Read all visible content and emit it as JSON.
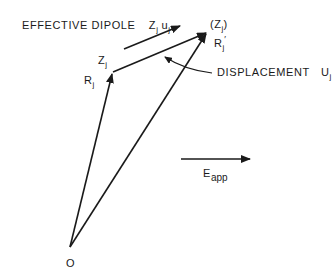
{
  "diagram": {
    "type": "vector-diagram",
    "labels": {
      "effective_dipole_text": "EFFECTIVE DIPOLE",
      "effective_dipole_symbol_z": "Z",
      "effective_dipole_symbol_z_sub": "j",
      "effective_dipole_symbol_u": "u",
      "effective_dipole_symbol_u_sub": "j",
      "zj_open": "(Z",
      "zj_sub": "j",
      "zj_close": ")",
      "rj_prime": "R",
      "rj_prime_sub": "j",
      "rj_prime_mark": "′",
      "zj_corner": "Z",
      "zj_corner_sub": "j",
      "rj": "R",
      "rj_sub": "j",
      "displacement_text": "DISPLACEMENT",
      "displacement_symbol": "U",
      "displacement_symbol_sub": "j",
      "eapp": "E",
      "eapp_sub": "app",
      "origin": "O"
    },
    "vectors": [
      {
        "name": "R_j",
        "from": "O",
        "to": "Z_j"
      },
      {
        "name": "R_j_prime",
        "from": "O",
        "to": "(Z_j)"
      },
      {
        "name": "U_j",
        "from": "Z_j",
        "to": "(Z_j)"
      },
      {
        "name": "effective_dipole",
        "direction": "parallel to U_j"
      },
      {
        "name": "E_app",
        "direction": "horizontal right"
      }
    ],
    "stroke_color": "#1a1a1a",
    "background": "#ffffff"
  }
}
